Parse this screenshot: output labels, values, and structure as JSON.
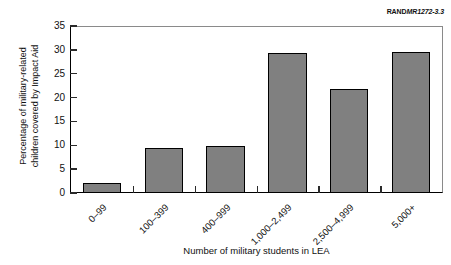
{
  "figure": {
    "source_credit": {
      "brand": "RAND",
      "doc_id": "MR1272-3.3"
    }
  },
  "chart_data": {
    "type": "bar",
    "title": "",
    "subtitle": "",
    "xlabel": "Number of military students in LEA",
    "ylabel": "Percentage of military-related children covered by Impact Aid",
    "ylabel_line1": "Percentage of military-related",
    "ylabel_line2": "children covered by Impact Aid",
    "categories": [
      "0–99",
      "100–399",
      "400–999",
      "1,000–2,499",
      "2,500–4,999",
      "5,000+"
    ],
    "values": [
      2.0,
      9.4,
      9.8,
      29.4,
      21.8,
      29.6
    ],
    "ylim": [
      0,
      35
    ],
    "ytick_labels": [
      "0",
      "5",
      "10",
      "15",
      "20",
      "25",
      "30",
      "35"
    ],
    "ytick_values": [
      0,
      5,
      10,
      15,
      20,
      25,
      30,
      35
    ],
    "grid": false,
    "legend": null,
    "bar_fill_color": "#808080",
    "bar_edge_color": "#000000",
    "axis_color": "#000000",
    "background_color": "#ffffff"
  }
}
